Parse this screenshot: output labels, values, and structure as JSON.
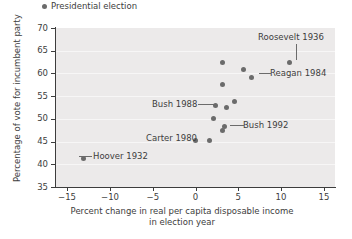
{
  "chart_data": {
    "type": "scatter",
    "title": "",
    "xlabel": "Percent change in real per capita disposable income in election year",
    "xlabel_line1": "Percent change in real per capita disposable income",
    "xlabel_line2": "in election year",
    "ylabel": "Percentage of vote for incumbent party",
    "xlim": [
      -17.5,
      17.5
    ],
    "ylim": [
      35,
      70
    ],
    "xticks": [
      -15,
      -10,
      -5,
      0,
      5,
      10,
      15
    ],
    "xtick_labels": [
      "−15",
      "−10",
      "−5",
      "0",
      "5",
      "10",
      "15"
    ],
    "yticks": [
      35,
      40,
      45,
      50,
      55,
      60,
      65,
      70
    ],
    "ytick_labels": [
      "35",
      "40",
      "45",
      "50",
      "55",
      "60",
      "65",
      "70"
    ],
    "grid": "horizontal-banded",
    "legend_position": "above-plot-left",
    "legend": [
      {
        "label": "Presidential election",
        "marker": "circle",
        "color": "#6b6b6b"
      }
    ],
    "series": [
      {
        "name": "Presidential election",
        "color": "#6b6b6b",
        "points": [
          {
            "x": -13.9,
            "y": 41.2,
            "label": "Hoover 1932"
          },
          {
            "x": 0.0,
            "y": 45.2,
            "label": "Carter 1980"
          },
          {
            "x": 1.8,
            "y": 45.2,
            "label": ""
          },
          {
            "x": 2.3,
            "y": 50.1,
            "label": ""
          },
          {
            "x": 3.4,
            "y": 47.5,
            "label": ""
          },
          {
            "x": 3.7,
            "y": 48.4,
            "label": "Bush 1992"
          },
          {
            "x": 2.5,
            "y": 53.0,
            "label": "Bush 1988"
          },
          {
            "x": 3.9,
            "y": 52.4,
            "label": ""
          },
          {
            "x": 4.9,
            "y": 53.9,
            "label": ""
          },
          {
            "x": 3.4,
            "y": 57.6,
            "label": ""
          },
          {
            "x": 3.4,
            "y": 62.5,
            "label": ""
          },
          {
            "x": 6.0,
            "y": 60.9,
            "label": ""
          },
          {
            "x": 7.1,
            "y": 59.2,
            "label": "Reagan 1984"
          },
          {
            "x": 11.8,
            "y": 62.5,
            "label": "Roosevelt 1936"
          }
        ]
      }
    ],
    "annotations": [
      {
        "text": "Roosevelt 1936",
        "anchor": "top"
      },
      {
        "text": "Reagan 1984",
        "anchor": "right"
      },
      {
        "text": "Bush 1988",
        "anchor": "left"
      },
      {
        "text": "Bush 1992",
        "anchor": "right"
      },
      {
        "text": "Carter 1980",
        "anchor": "left"
      },
      {
        "text": "Hoover 1932",
        "anchor": "right"
      }
    ]
  },
  "colors": {
    "marker": "#6b6b6b",
    "plot_background": "#eceaea",
    "grid_band": "#f7f6f6",
    "axis": "#3d3d3d",
    "text": "#3d3d3d"
  }
}
